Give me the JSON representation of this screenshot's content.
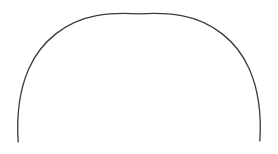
{
  "canvas": {
    "width": 278,
    "height": 154,
    "background_color": "#ffffff",
    "has_border": false,
    "description": "Single open arc line drawing on a plain white background"
  },
  "figure": {
    "name": "arc",
    "shape_type": "open-arc",
    "stroke_color": "#3a3a3a",
    "stroke_width": 1.3,
    "fill": "none",
    "closed": false,
    "apex": {
      "x": 139,
      "y": 14
    },
    "left_endpoint": {
      "x": 18,
      "y": 142
    },
    "right_endpoint": {
      "x": 259,
      "y": 141
    },
    "leftmost_x": 17,
    "rightmost_x": 260,
    "center": {
      "x": 138.5,
      "y": 78
    },
    "radius_x": 121,
    "radius_y": 64,
    "sweep_description": "slightly more than a half circle, open at the bottom",
    "path_d": "M 18.2 142.4 C 16.6 118.0 18.6 92.0 28.8 68.8 C 41.0 41.0 66.0 21.2 96.5 15.6 C 110.5 13.1 125.0 13.0 139.0 13.9 C 153.0 13.0 167.5 13.1 181.5 15.6 C 212.0 21.2 237.0 41.0 249.2 68.8 C 259.4 92.0 261.4 118.0 259.8 141.4"
  }
}
